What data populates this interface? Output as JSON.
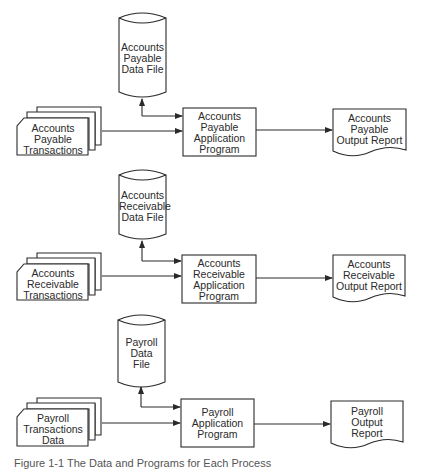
{
  "diagram": {
    "type": "system-flowchart",
    "rows": [
      {
        "data_file": [
          "Accounts",
          "Payable",
          "Data File"
        ],
        "transactions": [
          "Accounts",
          "Payable",
          "Transactions"
        ],
        "program": [
          "Accounts",
          "Payable",
          "Application",
          "Program"
        ],
        "report": [
          "Accounts",
          "Payable",
          "Output Report"
        ]
      },
      {
        "data_file": [
          "Accounts",
          "Receivable",
          "Data File"
        ],
        "transactions": [
          "Accounts",
          "Receivable",
          "Transactions"
        ],
        "program": [
          "Accounts",
          "Receivable",
          "Application",
          "Program"
        ],
        "report": [
          "Accounts",
          "Receivable",
          "Output Report"
        ]
      },
      {
        "data_file": [
          "Payroll",
          "Data",
          "File"
        ],
        "transactions": [
          "Payroll",
          "Transactions",
          "Data"
        ],
        "program": [
          "Payroll",
          "Application",
          "Program"
        ],
        "report": [
          "Payroll",
          "Output",
          "Report"
        ]
      }
    ],
    "caption": "Figure 1-1  The Data and Programs for Each Process"
  },
  "colors": {
    "stroke": "#2a2a2a",
    "background": "#ffffff"
  }
}
